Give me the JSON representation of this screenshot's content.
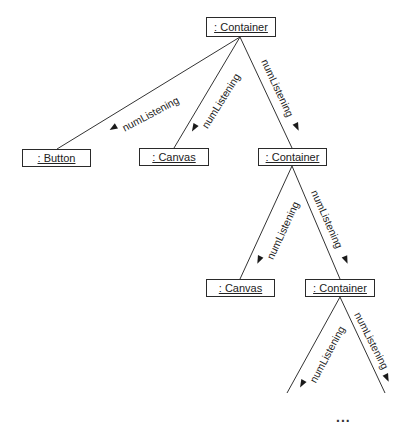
{
  "diagram": {
    "type": "object-collaboration",
    "nodes": [
      {
        "id": "root",
        "label": ": Container"
      },
      {
        "id": "button",
        "label": ": Button"
      },
      {
        "id": "canvas1",
        "label": ": Canvas"
      },
      {
        "id": "container2",
        "label": ": Container"
      },
      {
        "id": "canvas2",
        "label": ": Canvas"
      },
      {
        "id": "container3",
        "label": ": Container"
      }
    ],
    "edges": [
      {
        "from": "root",
        "to": "button",
        "label": "numListening",
        "arrow": "toward-child"
      },
      {
        "from": "root",
        "to": "canvas1",
        "label": "numListening",
        "arrow": "toward-child"
      },
      {
        "from": "root",
        "to": "container2",
        "label": "numListening",
        "arrow": "toward-child"
      },
      {
        "from": "container2",
        "to": "canvas2",
        "label": "numListening",
        "arrow": "toward-child"
      },
      {
        "from": "container2",
        "to": "container3",
        "label": "numListening",
        "arrow": "toward-child"
      },
      {
        "from": "container3",
        "to": "(continues)",
        "label": "numListening",
        "arrow": "toward-child"
      },
      {
        "from": "container3",
        "to": "(continues)",
        "label": "numListening",
        "arrow": "toward-child"
      }
    ],
    "continuation": "..."
  }
}
